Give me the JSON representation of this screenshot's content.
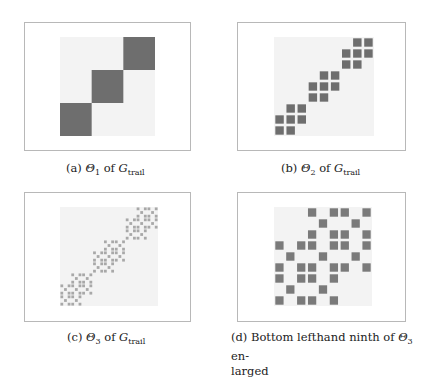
{
  "figure": {
    "panels": [
      {
        "id": "a",
        "label": "(a)",
        "theta": "Θ",
        "theta_index": "1",
        "of": "of",
        "graph": "G",
        "graph_sub": "trail",
        "level": 1,
        "mark_color": "#6e6e6e",
        "mark_opacity": 1.0
      },
      {
        "id": "b",
        "label": "(b)",
        "theta": "Θ",
        "theta_index": "2",
        "of": "of",
        "graph": "G",
        "graph_sub": "trail",
        "level": 2,
        "mark_color": "#6e6e6e",
        "mark_opacity": 1.0
      },
      {
        "id": "c",
        "label": "(c)",
        "theta": "Θ",
        "theta_index": "3",
        "of": "of",
        "graph": "G",
        "graph_sub": "trail",
        "level": 3,
        "mark_color": "#9a9a9a",
        "mark_opacity": 0.85
      },
      {
        "id": "d",
        "label": "(d)",
        "text_before": "Bottom lefthand ninth of",
        "theta": "Θ",
        "theta_index": "3",
        "text_after": "en-",
        "line2": "larged",
        "level": 3,
        "zoom": "bottom-left-ninth",
        "mark_color": "#7a7a7a",
        "mark_opacity": 1.0
      }
    ],
    "background_color": "#f3f3f3",
    "border_color": "#b8b8b8"
  }
}
